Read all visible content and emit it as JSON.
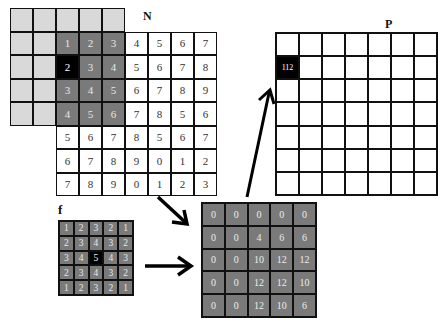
{
  "labels": {
    "n": "N",
    "p": "P",
    "f": "f"
  },
  "n_grid": {
    "rows": 8,
    "cols": 9,
    "cells": [
      [
        "",
        "",
        "",
        "",
        "",
        null,
        null,
        null,
        null
      ],
      [
        "",
        "",
        "1",
        "2",
        "3",
        "4",
        "5",
        "6",
        "7"
      ],
      [
        "",
        "",
        "2",
        "3",
        "4",
        "5",
        "6",
        "7",
        "8"
      ],
      [
        "",
        "",
        "3",
        "4",
        "5",
        "6",
        "7",
        "8",
        "9"
      ],
      [
        "",
        "",
        "4",
        "5",
        "6",
        "7",
        "8",
        "5",
        "6"
      ],
      [
        null,
        null,
        "5",
        "6",
        "7",
        "8",
        "5",
        "6",
        "7"
      ],
      [
        null,
        null,
        "6",
        "7",
        "8",
        "9",
        "0",
        "1",
        "2"
      ],
      [
        null,
        null,
        "7",
        "8",
        "9",
        "0",
        "1",
        "2",
        "3"
      ]
    ],
    "padding_cells_note": "light gray zero-padding region",
    "window_cells": "rows 1-4, cols 2-4",
    "center_cell": [
      2,
      2
    ]
  },
  "f_grid": {
    "cells": [
      [
        "1",
        "2",
        "3",
        "2",
        "1"
      ],
      [
        "2",
        "3",
        "4",
        "3",
        "2"
      ],
      [
        "3",
        "4",
        "5",
        "4",
        "3"
      ],
      [
        "2",
        "3",
        "4",
        "3",
        "2"
      ],
      [
        "1",
        "2",
        "3",
        "2",
        "1"
      ]
    ],
    "center_cell": [
      2,
      2
    ]
  },
  "result_grid": {
    "cells": [
      [
        "0",
        "0",
        "0",
        "0",
        "0"
      ],
      [
        "0",
        "0",
        "4",
        "6",
        "6"
      ],
      [
        "0",
        "0",
        "10",
        "12",
        "12"
      ],
      [
        "0",
        "0",
        "12",
        "12",
        "10"
      ],
      [
        "0",
        "0",
        "12",
        "10",
        "6"
      ]
    ]
  },
  "p_grid": {
    "rows": 7,
    "cols": 7,
    "highlight": {
      "row": 1,
      "col": 0,
      "value": "112"
    }
  },
  "colors": {
    "padding": "#d9d9d9",
    "window": "#7a7a7a",
    "center": "#000000",
    "grid_line": "#111111"
  }
}
